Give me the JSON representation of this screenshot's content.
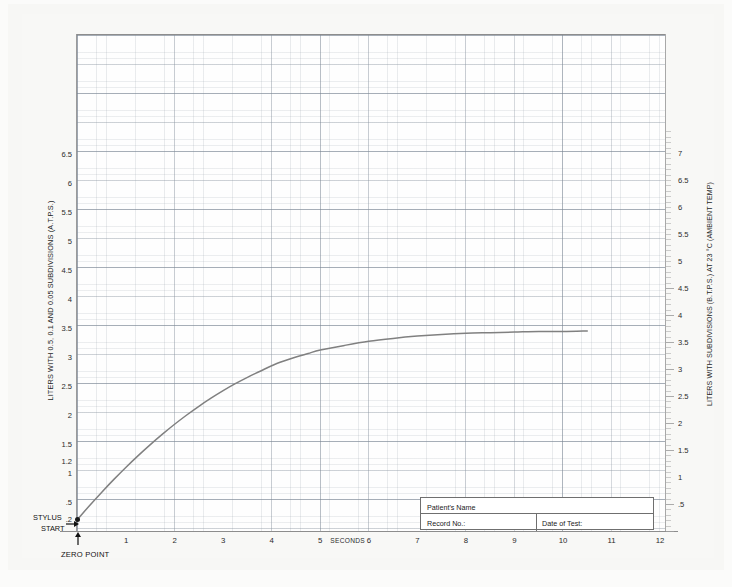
{
  "chart_data": {
    "type": "line",
    "xlabel": "SECONDS",
    "ylabel": "LITERS WITH 0.5, 0.1 AND 0.05 SUBDIVISIONS (A.T.P.S.)",
    "ylabel_right": "LITERS WITH SUBDIVISIONS (B.T.P.S.) AT 23 °C (AMBIENT TEMP)",
    "xlim": [
      0,
      12
    ],
    "ylim": [
      0,
      6.9
    ],
    "ylim_right": [
      0,
      7.4
    ],
    "grid": true,
    "legend": "none",
    "line_color": "#808080",
    "x_ticks": [
      "1",
      "2",
      "3",
      "4",
      "5",
      "6",
      "7",
      "8",
      "9",
      "10",
      "11",
      "12"
    ],
    "x_tick_values": [
      1,
      2,
      3,
      4,
      5,
      6,
      7,
      8,
      9,
      10,
      11,
      12
    ],
    "y_ticks_left": [
      ".2",
      ".5",
      "1",
      "1.2",
      "1.5",
      "2",
      "2.5",
      "3",
      "3.5",
      "4",
      "4.5",
      "5",
      "5.5",
      "6",
      "6.5"
    ],
    "y_tick_values_left": [
      0.2,
      0.5,
      1,
      1.2,
      1.5,
      2,
      2.5,
      3,
      3.5,
      4,
      4.5,
      5,
      5.5,
      6,
      6.5
    ],
    "y_ticks_right": [
      ".5",
      "1",
      "1.5",
      "2",
      "2.5",
      "3",
      "3.5",
      "4",
      "4.5",
      "5",
      "5.5",
      "6",
      "6.5",
      "7"
    ],
    "y_tick_values_right": [
      0.5,
      1,
      1.5,
      2,
      2.5,
      3,
      3.5,
      4,
      4.5,
      5,
      5.5,
      6,
      6.5,
      7
    ],
    "x": [
      0,
      0.25,
      0.5,
      0.75,
      1.0,
      1.25,
      1.5,
      1.75,
      2.0,
      2.25,
      2.5,
      2.75,
      3.0,
      3.25,
      3.5,
      3.75,
      4.0,
      4.25,
      4.5,
      4.75,
      5.0,
      5.5,
      6.0,
      6.5,
      7.0,
      7.5,
      8.0,
      8.5,
      9.0,
      9.5,
      10.0,
      10.5
    ],
    "y": [
      0.2,
      0.44,
      0.67,
      0.89,
      1.1,
      1.3,
      1.49,
      1.67,
      1.84,
      2.0,
      2.15,
      2.29,
      2.42,
      2.54,
      2.65,
      2.75,
      2.85,
      2.93,
      3.0,
      3.06,
      3.12,
      3.2,
      3.27,
      3.32,
      3.36,
      3.39,
      3.41,
      3.42,
      3.43,
      3.44,
      3.44,
      3.45
    ],
    "annotations": [
      "STYLUS",
      "START",
      "ZERO POINT"
    ],
    "plateau_value": 3.45,
    "start_value": 0.2
  },
  "axes": {
    "left_title": "LITERS WITH 0.5, 0.1 AND 0.05 SUBDIVISIONS (A.T.P.S.)",
    "right_title": "LITERS WITH SUBDIVISIONS (B.T.P.S.) AT 23 °C (AMBIENT TEMP)",
    "x_title": "SECONDS"
  },
  "annotations": {
    "stylus": "STYLUS",
    "start": "START",
    "zero_point": "ZERO POINT"
  },
  "patient_box": {
    "name_label": "Patient's Name",
    "record_label": "Record No.:",
    "date_label": "Date of Test:"
  },
  "colors": {
    "curve": "#808080",
    "grid": "#8a96a4",
    "page_background": "#f7f7f5",
    "plot_background": "#fefefe",
    "text": "#1f1f1f"
  }
}
